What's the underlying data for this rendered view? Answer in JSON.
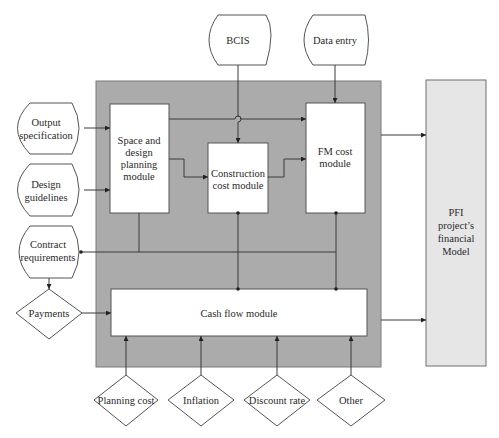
{
  "colors": {
    "outer_panel": "#ababab",
    "outer_panel_border": "#7a7a7a",
    "module_fill": "#ffffff",
    "pfi_fill": "#e6e6e6",
    "line": "#3a3a3a"
  },
  "inputs_top": {
    "bcis": "BCIS",
    "data_entry": "Data entry"
  },
  "inputs_left": {
    "output_spec": [
      "Output",
      "specification"
    ],
    "design_guidelines": [
      "Design",
      "guidelines"
    ],
    "contract_requirements": [
      "Contract",
      "requirements"
    ],
    "payments": "Payments"
  },
  "modules": {
    "space_design": [
      "Space and",
      "design",
      "planning",
      "module"
    ],
    "construction_cost": [
      "Construction",
      "cost module"
    ],
    "fm_cost": [
      "FM cost",
      "module"
    ],
    "cash_flow": "Cash flow module"
  },
  "inputs_bottom": {
    "planning_cost": "Planning cost",
    "inflation": "Inflation",
    "discount_rate": "Discount rate",
    "other": "Other"
  },
  "output": {
    "pfi_model": [
      "PFI",
      "project’s",
      "financial",
      "Model"
    ]
  }
}
